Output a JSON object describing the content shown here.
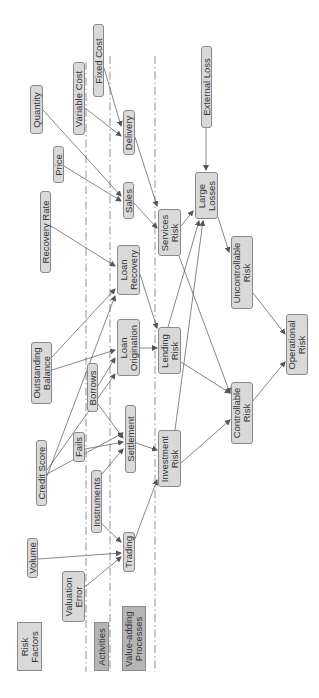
{
  "diagram": {
    "orientation": "rotated -90deg",
    "swimlane_dividers_x": [
      86,
      110,
      155
    ],
    "colors": {
      "node_fill": "#d9d9d9",
      "node_border": "#8a8a8a",
      "legend_dark_fill": "#b5b5b5",
      "edge": "#555555",
      "text": "#333333"
    },
    "nodes": [
      {
        "id": "fixed_cost",
        "label": "Fixed Cost",
        "x": 93,
        "y": 24,
        "w": 11,
        "h": 73,
        "style": "node"
      },
      {
        "id": "variable_cost",
        "label": "Variable Cost",
        "x": 73,
        "y": 62,
        "w": 12,
        "h": 73,
        "style": "node"
      },
      {
        "id": "quantity",
        "label": "Quantity",
        "x": 30,
        "y": 85,
        "w": 13,
        "h": 49,
        "style": "node"
      },
      {
        "id": "price",
        "label": "Price",
        "x": 53,
        "y": 146,
        "w": 11,
        "h": 37,
        "style": "node"
      },
      {
        "id": "external_loss",
        "label": "External Loss",
        "x": 201,
        "y": 46,
        "w": 11,
        "h": 82,
        "style": "node"
      },
      {
        "id": "delivery",
        "label": "Delivery",
        "x": 123,
        "y": 110,
        "w": 12,
        "h": 45,
        "style": "node"
      },
      {
        "id": "sales",
        "label": "Sales",
        "x": 123,
        "y": 182,
        "w": 11,
        "h": 37,
        "style": "node"
      },
      {
        "id": "large_losses",
        "label": "Large\nLosses",
        "x": 195,
        "y": 172,
        "w": 23,
        "h": 47,
        "style": "node"
      },
      {
        "id": "services_risk",
        "label": "Services\nRisk",
        "x": 158,
        "y": 209,
        "w": 23,
        "h": 47,
        "style": "node"
      },
      {
        "id": "recovery_rate",
        "label": "Recovery Rate",
        "x": 40,
        "y": 191,
        "w": 11,
        "h": 82,
        "style": "node"
      },
      {
        "id": "loan_recovery",
        "label": "Loan\nRecovery",
        "x": 117,
        "y": 245,
        "w": 23,
        "h": 50,
        "style": "node"
      },
      {
        "id": "uncontrollable_risk",
        "label": "Uncontrollable\nRisk",
        "x": 231,
        "y": 236,
        "w": 22,
        "h": 73,
        "style": "node"
      },
      {
        "id": "outstanding_balance",
        "label": "Outstanding\nBalance",
        "x": 31,
        "y": 342,
        "w": 21,
        "h": 62,
        "style": "node"
      },
      {
        "id": "loan_origination",
        "label": "Loan\nOrigination",
        "x": 117,
        "y": 319,
        "w": 23,
        "h": 57,
        "style": "node"
      },
      {
        "id": "lending_risk",
        "label": "Lending\nRisk",
        "x": 158,
        "y": 327,
        "w": 23,
        "h": 47,
        "style": "node"
      },
      {
        "id": "operational_risk",
        "label": "Operational\nRisk",
        "x": 286,
        "y": 314,
        "w": 22,
        "h": 61,
        "style": "node"
      },
      {
        "id": "borrows",
        "label": "Borrows",
        "x": 87,
        "y": 363,
        "w": 11,
        "h": 49,
        "style": "node"
      },
      {
        "id": "controllable_risk",
        "label": "Controllable\nRisk",
        "x": 231,
        "y": 382,
        "w": 22,
        "h": 62,
        "style": "node"
      },
      {
        "id": "credit_score",
        "label": "Credit Score",
        "x": 36,
        "y": 440,
        "w": 11,
        "h": 66,
        "style": "node"
      },
      {
        "id": "fails",
        "label": "Fails",
        "x": 73,
        "y": 432,
        "w": 12,
        "h": 30,
        "style": "node"
      },
      {
        "id": "settlement",
        "label": "Settlement",
        "x": 125,
        "y": 405,
        "w": 11,
        "h": 68,
        "style": "node"
      },
      {
        "id": "investment_risk",
        "label": "Investment\nRisk",
        "x": 158,
        "y": 430,
        "w": 23,
        "h": 57,
        "style": "node"
      },
      {
        "id": "instruments",
        "label": "Instruments",
        "x": 91,
        "y": 470,
        "w": 11,
        "h": 63,
        "style": "node"
      },
      {
        "id": "trading",
        "label": "Trading",
        "x": 123,
        "y": 532,
        "w": 12,
        "h": 40,
        "style": "node"
      },
      {
        "id": "volume",
        "label": "Volume",
        "x": 27,
        "y": 538,
        "w": 11,
        "h": 40,
        "style": "node"
      },
      {
        "id": "valuation_error",
        "label": "Valuation\nError",
        "x": 62,
        "y": 571,
        "w": 23,
        "h": 51,
        "style": "node"
      },
      {
        "id": "legend_risk_factors",
        "label": "Risk\nFactors",
        "x": 17,
        "y": 622,
        "w": 25,
        "h": 49,
        "style": "legend"
      },
      {
        "id": "legend_activities",
        "label": "Activities",
        "x": 94,
        "y": 622,
        "w": 15,
        "h": 49,
        "style": "legend-dark"
      },
      {
        "id": "legend_value_adding",
        "label": "Value-adding\nProcesses",
        "x": 122,
        "y": 606,
        "w": 24,
        "h": 65,
        "style": "legend-dark"
      }
    ],
    "edges": [
      {
        "from": "fixed_cost",
        "to": "delivery",
        "x1": 104,
        "y1": 68,
        "x2": 121,
        "y2": 126
      },
      {
        "from": "variable_cost",
        "to": "delivery",
        "x1": 85,
        "y1": 108,
        "x2": 121,
        "y2": 136
      },
      {
        "from": "quantity",
        "to": "sales",
        "x1": 43,
        "y1": 110,
        "x2": 121,
        "y2": 196
      },
      {
        "from": "price",
        "to": "sales",
        "x1": 64,
        "y1": 166,
        "x2": 121,
        "y2": 201
      },
      {
        "from": "delivery",
        "to": "services_risk",
        "x1": 135,
        "y1": 137,
        "x2": 157,
        "y2": 206
      },
      {
        "from": "sales",
        "to": "services_risk",
        "x1": 134,
        "y1": 203,
        "x2": 157,
        "y2": 228
      },
      {
        "from": "external_loss",
        "to": "large_losses",
        "x1": 206,
        "y1": 128,
        "x2": 206,
        "y2": 170
      },
      {
        "from": "services_risk",
        "to": "large_losses",
        "x1": 181,
        "y1": 226,
        "x2": 193,
        "y2": 211
      },
      {
        "from": "services_risk",
        "to": "controllable_risk",
        "x1": 179,
        "y1": 256,
        "x2": 230,
        "y2": 393
      },
      {
        "from": "large_losses",
        "to": "uncontrollable_risk",
        "x1": 218,
        "y1": 217,
        "x2": 229,
        "y2": 252
      },
      {
        "from": "recovery_rate",
        "to": "loan_recovery",
        "x1": 51,
        "y1": 226,
        "x2": 115,
        "y2": 266
      },
      {
        "from": "loan_recovery",
        "to": "lending_risk",
        "x1": 140,
        "y1": 274,
        "x2": 157,
        "y2": 328
      },
      {
        "from": "outstanding_balance",
        "to": "loan_recovery",
        "x1": 52,
        "y1": 357,
        "x2": 115,
        "y2": 289
      },
      {
        "from": "outstanding_balance",
        "to": "loan_origination",
        "x1": 52,
        "y1": 370,
        "x2": 115,
        "y2": 350
      },
      {
        "from": "loan_origination",
        "to": "lending_risk",
        "x1": 140,
        "y1": 348,
        "x2": 157,
        "y2": 348
      },
      {
        "from": "lending_risk",
        "to": "large_losses",
        "x1": 168,
        "y1": 327,
        "x2": 199,
        "y2": 221
      },
      {
        "from": "lending_risk",
        "to": "controllable_risk",
        "x1": 181,
        "y1": 362,
        "x2": 230,
        "y2": 393
      },
      {
        "from": "uncontrollable_risk",
        "to": "operational_risk",
        "x1": 253,
        "y1": 293,
        "x2": 285,
        "y2": 334
      },
      {
        "from": "controllable_risk",
        "to": "operational_risk",
        "x1": 253,
        "y1": 401,
        "x2": 285,
        "y2": 362
      },
      {
        "from": "credit_score",
        "to": "loan_recovery",
        "x1": 47,
        "y1": 476,
        "x2": 115,
        "y2": 296
      },
      {
        "from": "credit_score",
        "to": "loan_origination",
        "x1": 47,
        "y1": 470,
        "x2": 115,
        "y2": 374
      },
      {
        "from": "credit_score",
        "to": "settlement",
        "x1": 47,
        "y1": 474,
        "x2": 123,
        "y2": 433
      },
      {
        "from": "borrows",
        "to": "loan_origination",
        "x1": 98,
        "y1": 386,
        "x2": 115,
        "y2": 358
      },
      {
        "from": "borrows",
        "to": "settlement",
        "x1": 98,
        "y1": 404,
        "x2": 123,
        "y2": 438
      },
      {
        "from": "fails",
        "to": "settlement",
        "x1": 85,
        "y1": 449,
        "x2": 123,
        "y2": 442
      },
      {
        "from": "instruments",
        "to": "settlement",
        "x1": 102,
        "y1": 474,
        "x2": 123,
        "y2": 449
      },
      {
        "from": "settlement",
        "to": "investment_risk",
        "x1": 136,
        "y1": 443,
        "x2": 157,
        "y2": 450
      },
      {
        "from": "investment_risk",
        "to": "large_losses",
        "x1": 175,
        "y1": 430,
        "x2": 203,
        "y2": 221
      },
      {
        "from": "investment_risk",
        "to": "controllable_risk",
        "x1": 181,
        "y1": 463,
        "x2": 230,
        "y2": 420
      },
      {
        "from": "instruments",
        "to": "trading",
        "x1": 102,
        "y1": 524,
        "x2": 121,
        "y2": 542
      },
      {
        "from": "volume",
        "to": "trading",
        "x1": 38,
        "y1": 559,
        "x2": 121,
        "y2": 553
      },
      {
        "from": "valuation_error",
        "to": "trading",
        "x1": 85,
        "y1": 587,
        "x2": 121,
        "y2": 557
      },
      {
        "from": "trading",
        "to": "investment_risk",
        "x1": 135,
        "y1": 539,
        "x2": 157,
        "y2": 480
      }
    ]
  }
}
